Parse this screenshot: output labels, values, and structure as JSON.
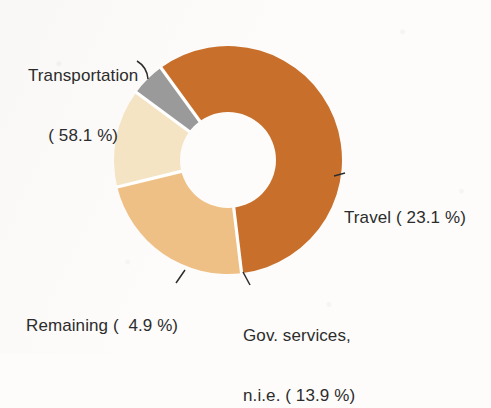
{
  "chart_data": {
    "type": "pie",
    "variant": "donut",
    "title": "",
    "subtitle": "",
    "xlabel": "",
    "ylabel": "",
    "units": "percent",
    "legend_position": "none",
    "grid": false,
    "labels_inline": true,
    "start_angle_deg": -36,
    "direction": "clockwise",
    "categories": [
      "Transportation",
      "Travel",
      "Gov. services, n.i.e.",
      "Remaining"
    ],
    "values": [
      58.1,
      23.1,
      13.9,
      4.9
    ],
    "colors": [
      "#C8702B",
      "#EFC085",
      "#F5E4C3",
      "#9A9A9A"
    ],
    "slices": [
      {
        "name": "Transportation",
        "value": 58.1,
        "color": "#C8702B",
        "label_lines": [
          "Transportation",
          "( 58.1 %)"
        ],
        "label_position": "top-left",
        "leader": true
      },
      {
        "name": "Travel",
        "value": 23.1,
        "color": "#EFC085",
        "label_lines": [
          "Travel ( 23.1 %)"
        ],
        "label_position": "right",
        "leader": true
      },
      {
        "name": "Gov. services, n.i.e.",
        "value": 13.9,
        "color": "#F5E4C3",
        "label_lines": [
          "Gov. services,",
          "n.i.e. ( 13.9 %)"
        ],
        "label_position": "bottom",
        "leader": true
      },
      {
        "name": "Remaining",
        "value": 4.9,
        "color": "#9A9A9A",
        "label_lines": [
          "Remaining (  4.9 %)"
        ],
        "label_position": "bottom-left",
        "leader": true
      }
    ]
  },
  "labels": {
    "transportation_line1": "Transportation",
    "transportation_line2": "( 58.1 %)",
    "travel": "Travel ( 23.1 %)",
    "remaining": "Remaining (  4.9 %)",
    "gov_line1": "Gov. services,",
    "gov_line2": "n.i.e. ( 13.9 %)"
  },
  "style": {
    "background": "#fdfcfb",
    "text_color": "#2c2c2c",
    "gap_color": "#ffffff",
    "center_x": 228,
    "center_y": 160,
    "outer_radius": 114,
    "inner_radius": 48
  }
}
